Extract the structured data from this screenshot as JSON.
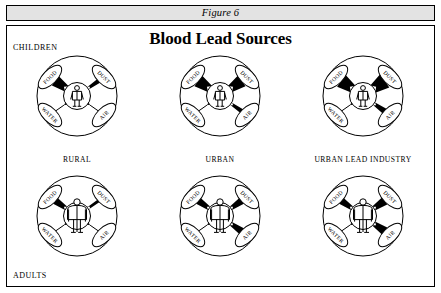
{
  "header": {
    "caption": "Figure 6"
  },
  "panel": {
    "title": "Blood Lead Sources",
    "row_labels": {
      "top": "CHILDREN",
      "bottom": "ADULTS"
    }
  },
  "pathway_labels": {
    "food": "FOOD",
    "dust": "DUST",
    "water": "WATER",
    "air": "AIR"
  },
  "colors": {
    "header_bar": "#e3e3e3",
    "border": "#000000",
    "panel_background": "#ffffff",
    "wedge_fill": "#000000"
  },
  "chart_data": {
    "type": "diagram",
    "title": "Blood Lead Sources",
    "figure_caption": "Figure 6",
    "row_categories": [
      "CHILDREN",
      "ADULTS"
    ],
    "column_categories": [
      "RURAL",
      "URBAN",
      "URBAN LEAD INDUSTRY"
    ],
    "pathways": [
      "FOOD",
      "DUST",
      "WATER",
      "AIR"
    ],
    "thickness_scale": {
      "units": "relative wedge width (0 = hairline, 10 = widest)",
      "min": 0,
      "max": 10
    },
    "cells": [
      {
        "row": "CHILDREN",
        "column": "RURAL",
        "center_figure": "child",
        "values": {
          "FOOD": 7,
          "DUST": 2,
          "WATER": 0,
          "AIR": 0
        }
      },
      {
        "row": "CHILDREN",
        "column": "URBAN",
        "center_figure": "child",
        "values": {
          "FOOD": 8,
          "DUST": 8,
          "WATER": 0,
          "AIR": 2
        }
      },
      {
        "row": "CHILDREN",
        "column": "URBAN LEAD INDUSTRY",
        "center_figure": "child",
        "values": {
          "FOOD": 9,
          "DUST": 10,
          "WATER": 0,
          "AIR": 3
        }
      },
      {
        "row": "ADULTS",
        "column": "RURAL",
        "center_figure": "adult",
        "values": {
          "FOOD": 4,
          "DUST": 1,
          "WATER": 0,
          "AIR": 0
        }
      },
      {
        "row": "ADULTS",
        "column": "URBAN",
        "center_figure": "adult",
        "values": {
          "FOOD": 4,
          "DUST": 4,
          "WATER": 0,
          "AIR": 4
        }
      },
      {
        "row": "ADULTS",
        "column": "URBAN LEAD INDUSTRY",
        "center_figure": "adult",
        "values": {
          "FOOD": 4,
          "DUST": 5,
          "WATER": 0,
          "AIR": 5
        }
      }
    ]
  }
}
